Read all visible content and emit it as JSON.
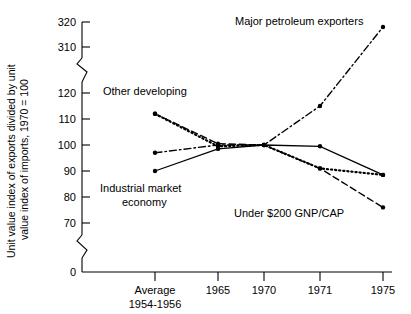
{
  "chart_data": {
    "type": "line",
    "title": "",
    "xlabel": "",
    "ylabel": "Unit value index of exports divided by unit value index of imports, 1970 = 100",
    "categories": [
      "Average 1954-1956",
      "1965",
      "1970",
      "1971",
      "1975"
    ],
    "x_tick_labels": [
      "Average",
      "1965",
      "1970",
      "1971",
      "1975"
    ],
    "x_tick_sublabel": "1954-1956",
    "y_tick_labels": [
      "0",
      "70",
      "80",
      "90",
      "100",
      "110",
      "120",
      "310",
      "320"
    ],
    "y_axis_breaks": [
      "between 0 and 70",
      "between 120 and 310"
    ],
    "ylim": [
      0,
      320
    ],
    "grid": false,
    "legend_position": "inline annotations",
    "series": [
      {
        "name": "Industrial market economy",
        "line_style": "solid",
        "values": [
          90,
          98.5,
          100,
          99.5,
          88.5
        ]
      },
      {
        "name": "Other developing",
        "line_style": "dotted",
        "values": [
          112,
          99.5,
          100,
          91,
          88.5
        ]
      },
      {
        "name": "Under $200 GNP/CAP",
        "line_style": "dashed",
        "values": [
          112,
          100.5,
          100,
          91,
          76
        ]
      },
      {
        "name": "Major petroleum exporters",
        "line_style": "dash-dot",
        "values": [
          97,
          100,
          100,
          115,
          318
        ]
      }
    ],
    "annotations": [
      {
        "text": "Other developing",
        "series": "Other developing"
      },
      {
        "text": "Industrial market",
        "series": "Industrial market economy"
      },
      {
        "text": "economy",
        "series": "Industrial market economy"
      },
      {
        "text": "Major petroleum exporters",
        "series": "Major petroleum exporters"
      },
      {
        "text": "Under $200 GNP/CAP",
        "series": "Under $200 GNP/CAP"
      }
    ]
  },
  "axis": {
    "y_title_line1": "Unit value index of exports divided by unit",
    "y_title_line2": "value index of imports, 1970 = 100",
    "y_ticks": [
      {
        "label": "320"
      },
      {
        "label": "310"
      },
      {
        "label": "120"
      },
      {
        "label": "110"
      },
      {
        "label": "100"
      },
      {
        "label": "90"
      },
      {
        "label": "80"
      },
      {
        "label": "70"
      },
      {
        "label": "0"
      }
    ],
    "x_ticks": [
      {
        "label": "Average",
        "sublabel": "1954-1956"
      },
      {
        "label": "1965",
        "sublabel": ""
      },
      {
        "label": "1970",
        "sublabel": ""
      },
      {
        "label": "1971",
        "sublabel": ""
      },
      {
        "label": "1975",
        "sublabel": ""
      }
    ]
  },
  "labels": {
    "other_developing": "Other developing",
    "industrial_line1": "Industrial market",
    "industrial_line2": "economy",
    "petroleum": "Major petroleum exporters",
    "under200": "Under $200 GNP/CAP"
  },
  "colors": {
    "ink": "#000000",
    "background": "#ffffff"
  }
}
